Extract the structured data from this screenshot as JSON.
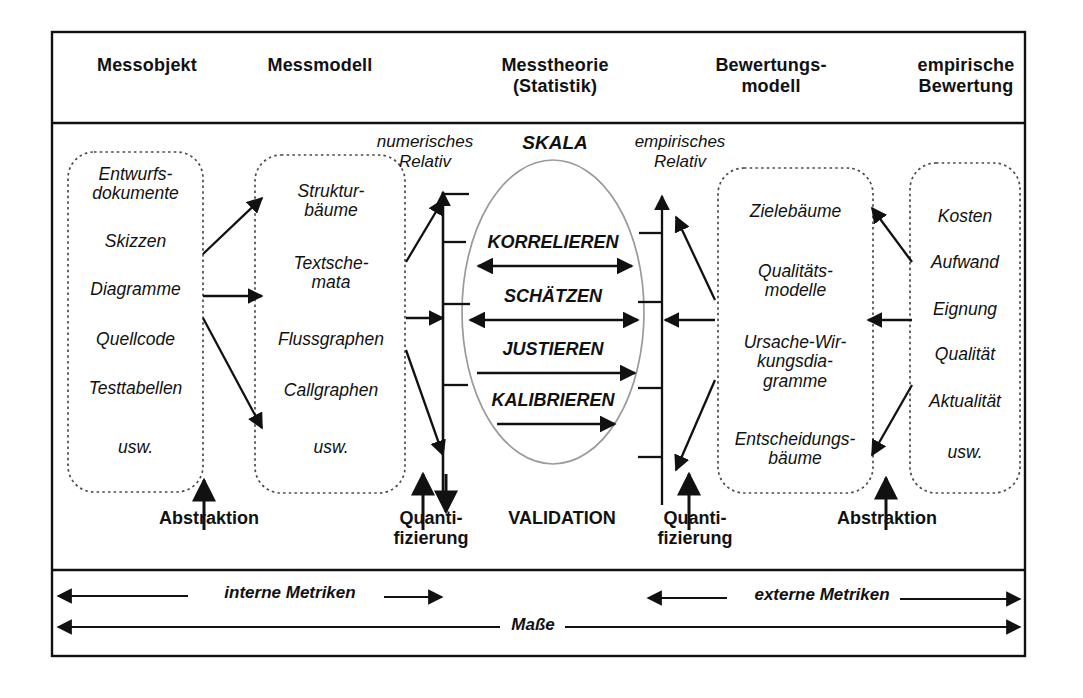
{
  "figure": {
    "title_row": {
      "columns": [
        {
          "id": "messobjekt",
          "label": "Messobjekt"
        },
        {
          "id": "messmodell",
          "label": "Messmodell"
        },
        {
          "id": "messtheorie",
          "label": "Messtheorie\n(Statistik)"
        },
        {
          "id": "bewertungsmodell",
          "label": "Bewertungs-\nmodell"
        },
        {
          "id": "empirische-bewertung",
          "label": "empirische\nBewertung"
        }
      ]
    },
    "boxes": {
      "messobjekt": {
        "items": [
          "Entwurfs-\ndokumente",
          "Skizzen",
          "Diagramme",
          "Quellcode",
          "Testtabellen",
          "usw."
        ]
      },
      "messmodell": {
        "items": [
          "Struktur-\nbäume",
          "Textsche-\nmata",
          "Flussgraphen",
          "Callgraphen",
          "usw."
        ]
      },
      "bewertungsmodell": {
        "items": [
          "Zielebäume",
          "Qualitäts-\nmodelle",
          "Ursache-Wir-\nkungsdia-\ngramme",
          "Entscheidungs-\nbäume"
        ]
      },
      "empirische_bewertung": {
        "items": [
          "Kosten",
          "Aufwand",
          "Eignung",
          "Qualität",
          "Aktualität",
          "usw."
        ]
      }
    },
    "annotations": {
      "numerisches_relativ": "numerisches\nRelativ",
      "skala": "SKALA",
      "empirisches_relativ": "empirisches\nRelativ"
    },
    "ellipse_operations": [
      {
        "id": "korrelieren",
        "label": "KORRELIEREN",
        "arrow": "bidirectional"
      },
      {
        "id": "schaetzen",
        "label": "SCHÄTZEN",
        "arrow": "bidirectional"
      },
      {
        "id": "justieren",
        "label": "JUSTIEREN",
        "arrow": "right"
      },
      {
        "id": "kalibrieren",
        "label": "KALIBRIEREN",
        "arrow": "right-short"
      }
    ],
    "bottom_labels": [
      {
        "id": "abstraktion-left",
        "label": "Abstraktion"
      },
      {
        "id": "quantifizierung-left",
        "label": "Quanti-\nfizierung"
      },
      {
        "id": "validation",
        "label": "VALIDATION"
      },
      {
        "id": "quantifizierung-right",
        "label": "Quanti-\nfizierung"
      },
      {
        "id": "abstraktion-right",
        "label": "Abstraktion"
      }
    ],
    "metric_arrows": [
      {
        "id": "interne-metriken",
        "label": "interne Metriken"
      },
      {
        "id": "externe-metriken",
        "label": "externe Metriken"
      },
      {
        "id": "masse",
        "label": "Maße"
      }
    ],
    "colors": {
      "ink": "#111111",
      "background": "#ffffff",
      "dotted_box_stroke": "#555555",
      "ellipse_stroke": "#999999"
    }
  }
}
